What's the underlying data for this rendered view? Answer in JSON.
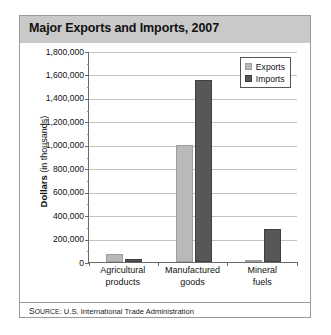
{
  "figure": {
    "title": "Major Exports and Imports, 2007",
    "source_prefix_caps": "S",
    "source_prefix_small": "OURCE",
    "source_text": ": U.S. International Trade Administration",
    "source_full": "SOURCE: U.S. International Trade Administration"
  },
  "legend": {
    "position": "top-right",
    "items": [
      {
        "label": "Exports",
        "color": "#b9b9b9"
      },
      {
        "label": "Imports",
        "color": "#575757"
      }
    ]
  },
  "axis": {
    "y_title_strong": "Dollars",
    "y_title_rest": " (in thousands)",
    "y_ticks": [
      "1,800,000",
      "1,600,000",
      "1,400,000",
      "1,200,000",
      "1,000,000",
      "800,000",
      "600,000",
      "400,000",
      "200,000",
      "0"
    ]
  },
  "chart_data": {
    "type": "bar",
    "title": "Major Exports and Imports, 2007",
    "xlabel": "",
    "ylabel": "Dollars (in thousands)",
    "categories": [
      "Agricultural products",
      "Manufactured goods",
      "Mineral fuels"
    ],
    "category_lines": [
      [
        "Agricultural",
        "products"
      ],
      [
        "Manufactured",
        "goods"
      ],
      [
        "Mineral",
        "fuels"
      ]
    ],
    "series": [
      {
        "name": "Exports",
        "color": "#b9b9b9",
        "values": [
          65000,
          1000000,
          12000
        ]
      },
      {
        "name": "Imports",
        "color": "#575757",
        "values": [
          25000,
          1550000,
          280000
        ]
      }
    ],
    "ylim": [
      0,
      1800000
    ],
    "ytick_step": 200000,
    "grid": true,
    "legend_position": "top-right",
    "units": "thousands of dollars",
    "source": "U.S. International Trade Administration"
  }
}
